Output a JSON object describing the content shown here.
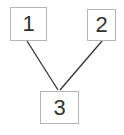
{
  "diagram": {
    "nodes": [
      {
        "id": "1",
        "label": "1"
      },
      {
        "id": "2",
        "label": "2"
      },
      {
        "id": "3",
        "label": "3"
      }
    ],
    "edges": [
      {
        "from": "1",
        "to": "3"
      },
      {
        "from": "2",
        "to": "3"
      }
    ]
  }
}
